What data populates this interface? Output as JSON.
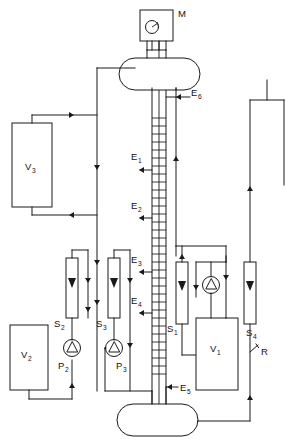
{
  "figure": {
    "type": "process-flow-diagram",
    "title": "",
    "caption_partial": "",
    "background": "#ffffff",
    "line_color": "#1a1a1a"
  },
  "labels": {
    "motor": "M",
    "vessel_v1": "V",
    "vessel_v1_sub": "1",
    "vessel_v2": "V",
    "vessel_v2_sub": "2",
    "vessel_v3": "V",
    "vessel_v3_sub": "3",
    "pump_p2": "P",
    "pump_p2_sub": "2",
    "pump_p3": "P",
    "pump_p3_sub": "3",
    "column_s1": "S",
    "column_s1_sub": "1",
    "column_s2": "S",
    "column_s2_sub": "2",
    "column_s3": "S",
    "column_s3_sub": "3",
    "column_s4": "S",
    "column_s4_sub": "4",
    "port_e1": "E",
    "port_e1_sub": "1",
    "port_e2": "E",
    "port_e2_sub": "2",
    "port_e3": "E",
    "port_e3_sub": "3",
    "port_e4": "E",
    "port_e4_sub": "4",
    "port_e5": "E",
    "port_e5_sub": "5",
    "port_e6": "E",
    "port_e6_sub": "6",
    "tap_r": "R"
  },
  "components": [
    {
      "id": "M",
      "kind": "motor-drive",
      "name": "motor-box"
    },
    {
      "id": "V1",
      "kind": "storage-vessel",
      "name": "vessel-v1"
    },
    {
      "id": "V2",
      "kind": "storage-vessel",
      "name": "vessel-v2"
    },
    {
      "id": "V3",
      "kind": "storage-vessel",
      "name": "vessel-v3"
    },
    {
      "id": "P2",
      "kind": "centrifugal-pump",
      "name": "pump-p2"
    },
    {
      "id": "P3",
      "kind": "centrifugal-pump",
      "name": "pump-p3"
    },
    {
      "id": "P1",
      "kind": "centrifugal-pump",
      "name": "pump-v1-loop"
    },
    {
      "id": "S1",
      "kind": "packed-bed-column",
      "name": "column-s1"
    },
    {
      "id": "S2",
      "kind": "packed-bed-column",
      "name": "column-s2"
    },
    {
      "id": "S3",
      "kind": "packed-bed-column",
      "name": "column-s3"
    },
    {
      "id": "S4",
      "kind": "packed-bed-column",
      "name": "column-s4"
    },
    {
      "id": "TOP",
      "kind": "horizontal-drum",
      "name": "top-drum"
    },
    {
      "id": "BOTTOM",
      "kind": "horizontal-drum",
      "name": "bottom-drum"
    },
    {
      "id": "COL",
      "kind": "packed-column",
      "name": "main-column"
    },
    {
      "id": "R",
      "kind": "sample-tap",
      "name": "tap-r"
    }
  ],
  "ports": [
    {
      "id": "E1",
      "direction": "out-left"
    },
    {
      "id": "E2",
      "direction": "out-left"
    },
    {
      "id": "E3",
      "direction": "out-left"
    },
    {
      "id": "E4",
      "direction": "out-left"
    },
    {
      "id": "E5",
      "direction": "in-right"
    },
    {
      "id": "E6",
      "direction": "in-right"
    }
  ]
}
